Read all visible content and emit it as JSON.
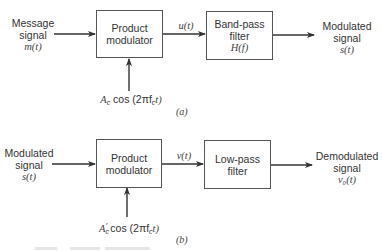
{
  "diagrams": [
    {
      "id": "a",
      "label": "(a)",
      "input": {
        "line1": "Message",
        "line2": "signal",
        "symbol": "m(t)"
      },
      "block1": {
        "line1": "Product",
        "line2": "modulator"
      },
      "carrier": {
        "amp": "A",
        "amp_sub": "c",
        "amp_prime": "",
        "text": " cos (2πf",
        "freq_sub": "c",
        "tail": "t)"
      },
      "intermediate": "u(t)",
      "block2": {
        "line1": "Band-pass",
        "line2": "filter",
        "symbol": "H(f)"
      },
      "output": {
        "line1": "Modulated",
        "line2": "signal",
        "symbol": "s(t)"
      }
    },
    {
      "id": "b",
      "label": "(b)",
      "input": {
        "line1": "Modulated",
        "line2": "signal",
        "symbol": "s(t)"
      },
      "block1": {
        "line1": "Product",
        "line2": "modulator"
      },
      "carrier": {
        "amp": "A",
        "amp_sub": "c",
        "amp_prime": "′",
        "text": " cos (2πf",
        "freq_sub": "c",
        "tail": "t)"
      },
      "intermediate": "v(t)",
      "block2": {
        "line1": "Low-pass",
        "line2": "filter",
        "symbol": ""
      },
      "output": {
        "line1": "Demodulated",
        "line2": "signal",
        "symbol": "v₀(t)"
      }
    }
  ],
  "colors": {
    "line": "#333333",
    "box_border": "#555555",
    "text": "#333333"
  }
}
